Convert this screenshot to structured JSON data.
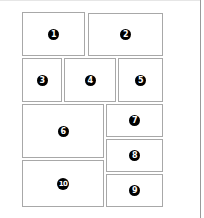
{
  "diagram": {
    "boxes": [
      {
        "id": 1,
        "label": "1",
        "x": 22,
        "y": 12,
        "w": 63,
        "h": 44
      },
      {
        "id": 2,
        "label": "2",
        "x": 88,
        "y": 13,
        "w": 75,
        "h": 43
      },
      {
        "id": 3,
        "label": "3",
        "x": 22,
        "y": 58,
        "w": 40,
        "h": 44
      },
      {
        "id": 4,
        "label": "4",
        "x": 64,
        "y": 58,
        "w": 52,
        "h": 44
      },
      {
        "id": 5,
        "label": "5",
        "x": 118,
        "y": 58,
        "w": 45,
        "h": 44
      },
      {
        "id": 6,
        "label": "6",
        "x": 22,
        "y": 104,
        "w": 82,
        "h": 54
      },
      {
        "id": 7,
        "label": "7",
        "x": 106,
        "y": 104,
        "w": 57,
        "h": 33
      },
      {
        "id": 8,
        "label": "8",
        "x": 106,
        "y": 139,
        "w": 57,
        "h": 33
      },
      {
        "id": 9,
        "label": "9",
        "x": 106,
        "y": 174,
        "w": 57,
        "h": 33
      },
      {
        "id": 10,
        "label": "10",
        "x": 22,
        "y": 160,
        "w": 82,
        "h": 47
      }
    ]
  }
}
